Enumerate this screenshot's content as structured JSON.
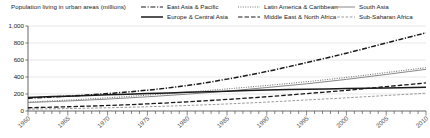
{
  "chart_data": {
    "type": "line",
    "title": "Population living in urban areas (millions)",
    "xlabel": "",
    "ylabel": "",
    "xlim": [
      1960,
      2010
    ],
    "ylim": [
      0,
      1000
    ],
    "yticks": [
      "0",
      "200",
      "400",
      "600",
      "800",
      "1,000"
    ],
    "ytick_values": [
      0,
      200,
      400,
      600,
      800,
      1000
    ],
    "xticks": [
      "1960",
      "1965",
      "1970",
      "1975",
      "1980",
      "1985",
      "1990",
      "1995",
      "2000",
      "2005",
      "2010"
    ],
    "xtick_values": [
      1960,
      1965,
      1970,
      1975,
      1980,
      1985,
      1990,
      1995,
      2000,
      2005,
      2010
    ],
    "grid": true,
    "grid_axis": "y",
    "legend_position": "top-right",
    "legend_columns": 3,
    "x": [
      1960,
      1965,
      1970,
      1975,
      1980,
      1985,
      1990,
      1995,
      2000,
      2005,
      2010
    ],
    "series": [
      {
        "name": "East Asia & Pacific",
        "style": "dash-dot",
        "color": "#1a1a1a",
        "width": 1.5,
        "values": [
          150,
          175,
          205,
          245,
          300,
          375,
          465,
          570,
          680,
          800,
          920
        ]
      },
      {
        "name": "Europe & Central Asia",
        "style": "solid",
        "color": "#1a1a1a",
        "width": 1.5,
        "values": [
          160,
          175,
          190,
          205,
          220,
          233,
          246,
          256,
          264,
          272,
          280
        ]
      },
      {
        "name": "Latin America & Caribbean",
        "style": "dotted",
        "color": "#777777",
        "width": 1.1,
        "values": [
          105,
          128,
          155,
          187,
          222,
          260,
          300,
          345,
          395,
          452,
          510
        ]
      },
      {
        "name": "Middle East & North Africa",
        "style": "long-dash",
        "color": "#1a1a1a",
        "width": 1.3,
        "values": [
          38,
          50,
          65,
          84,
          108,
          136,
          168,
          205,
          243,
          287,
          330
        ]
      },
      {
        "name": "South Asia",
        "style": "solid-thin",
        "color": "#888888",
        "width": 1.0,
        "values": [
          100,
          118,
          140,
          167,
          198,
          234,
          276,
          320,
          372,
          430,
          490
        ]
      },
      {
        "name": "Sub-Saharan Africa",
        "style": "fine-dash",
        "color": "#999999",
        "width": 1.0,
        "values": [
          22,
          29,
          38,
          50,
          65,
          83,
          105,
          130,
          155,
          182,
          210
        ]
      }
    ]
  },
  "legend": {
    "columns": [
      [
        {
          "label": "East Asia & Pacific",
          "style": "dash-dot",
          "color": "#1a1a1a"
        },
        {
          "label": "Europe & Central Asia",
          "style": "solid",
          "color": "#1a1a1a"
        }
      ],
      [
        {
          "label": "Latin America & Caribbean",
          "style": "dotted",
          "color": "#777777"
        },
        {
          "label": "Middle East & North Africa",
          "style": "long-dash",
          "color": "#1a1a1a"
        }
      ],
      [
        {
          "label": "South Asia",
          "style": "solid-thin",
          "color": "#888888"
        },
        {
          "label": "Sub-Saharan Africa",
          "style": "fine-dash",
          "color": "#999999"
        }
      ]
    ]
  },
  "axis": {
    "axis_color": "#555555",
    "grid_color": "#d8d8d8"
  }
}
